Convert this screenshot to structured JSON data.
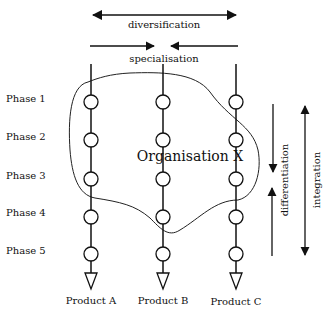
{
  "top": {
    "diversification_label": "diversification",
    "specialisation_label": "specialisation"
  },
  "phases": [
    "Phase 1",
    "Phase 2",
    "Phase 3",
    "Phase 4",
    "Phase 5"
  ],
  "products": [
    "Product A",
    "Product B",
    "Product C"
  ],
  "organisation_label": "Organisation X",
  "right": {
    "differentiation_label": "differentiation",
    "integration_label": "integration"
  }
}
